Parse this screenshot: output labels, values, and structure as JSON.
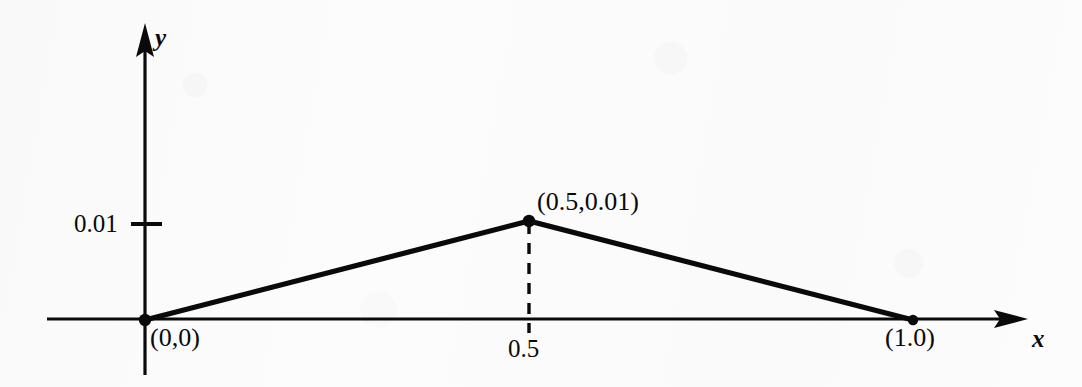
{
  "figure": {
    "type": "line-plot",
    "background_color": "#fcfcfc",
    "ink_color": "#0a0a0a"
  },
  "axes": {
    "x_name": "x",
    "y_name": "y",
    "x_arrow": "arrow-right",
    "y_arrow": "arrow-up"
  },
  "ticks": {
    "y": [
      {
        "label": "0.01",
        "value": 0.01
      }
    ],
    "x": [
      {
        "label": "0.5",
        "value": 0.5
      }
    ]
  },
  "point_labels": {
    "origin": "(0,0)",
    "peak": "(0.5,0.01)",
    "end": "(1.0)"
  },
  "chart_data": {
    "type": "line",
    "title": "",
    "subtitle": "",
    "xlabel": "x",
    "ylabel": "y",
    "x": [
      0,
      0.5,
      1.0
    ],
    "values": [
      0,
      0.01,
      0
    ],
    "series": [
      {
        "name": "triangular function",
        "x": [
          0,
          0.5,
          1.0
        ],
        "values": [
          0,
          0.01,
          0
        ]
      }
    ],
    "markers": [
      {
        "x": 0,
        "y": 0,
        "label": "(0,0)",
        "style": "filled-dot"
      },
      {
        "x": 0.5,
        "y": 0.01,
        "label": "(0.5,0.01)",
        "style": "filled-dot"
      },
      {
        "x": 1.0,
        "y": 0,
        "label": "(1.0)",
        "style": "filled-dot"
      }
    ],
    "annotations": [
      {
        "type": "dashed-vertical",
        "x": 0.5,
        "from_y": 0,
        "to_y": 0.01
      }
    ],
    "xlim": [
      0,
      1.0
    ],
    "ylim": [
      0,
      0.01
    ],
    "xticks": [
      0.5
    ],
    "xticklabels": [
      "0.5"
    ],
    "yticks": [
      0.01
    ],
    "yticklabels": [
      "0.01"
    ],
    "grid": false,
    "legend": false,
    "legend_position": "none"
  }
}
